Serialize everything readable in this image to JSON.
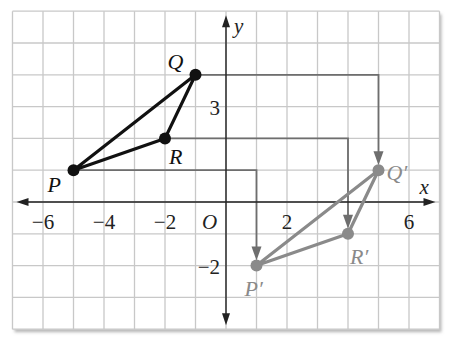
{
  "diagram": {
    "type": "coordinate-plane-translation",
    "axes": {
      "x_label": "x",
      "y_label": "y",
      "origin_label": "O",
      "x_range": [
        -7,
        7
      ],
      "y_range": [
        -4,
        6
      ],
      "x_ticks": [
        {
          "value": -6,
          "label": "−6"
        },
        {
          "value": -4,
          "label": "−4"
        },
        {
          "value": -2,
          "label": "−2"
        },
        {
          "value": 2,
          "label": "2"
        },
        {
          "value": 6,
          "label": "6"
        }
      ],
      "y_ticks": [
        {
          "value": 3,
          "label": "3"
        },
        {
          "value": -2,
          "label": "−2"
        }
      ]
    },
    "preimage": {
      "color": "#111111",
      "points": [
        {
          "name": "P",
          "label": "P",
          "x": -5,
          "y": 1,
          "label_dx": -26,
          "label_dy": 22
        },
        {
          "name": "Q",
          "label": "Q",
          "x": -1,
          "y": 4,
          "label_dx": -28,
          "label_dy": -6
        },
        {
          "name": "R",
          "label": "R",
          "x": -2,
          "y": 2,
          "label_dx": 4,
          "label_dy": 26
        }
      ]
    },
    "image": {
      "color": "#8a8a8a",
      "points": [
        {
          "name": "P'",
          "label": "P′",
          "x": 1,
          "y": -2,
          "label_dx": -12,
          "label_dy": 30
        },
        {
          "name": "Q'",
          "label": "Q′",
          "x": 5,
          "y": 1,
          "label_dx": 8,
          "label_dy": 10
        },
        {
          "name": "R'",
          "label": "R′",
          "x": 4,
          "y": -1,
          "label_dx": 2,
          "label_dy": 30
        }
      ]
    },
    "translation_vector": {
      "dx": 6,
      "dy": -3
    },
    "arrow_color": "#6e6e6e",
    "grid_color": "#c8c8c8",
    "axis_color": "#222222"
  }
}
